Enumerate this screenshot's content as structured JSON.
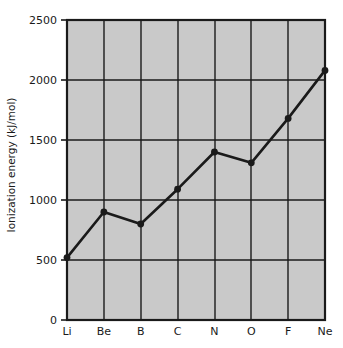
{
  "chart_data": {
    "type": "line",
    "title": "",
    "xlabel": "",
    "ylabel": "Ionization energy (kJ/mol)",
    "categories": [
      "Li",
      "Be",
      "B",
      "C",
      "N",
      "O",
      "F",
      "Ne"
    ],
    "values": [
      520,
      900,
      800,
      1090,
      1400,
      1310,
      1680,
      2080
    ],
    "series": [
      {
        "name": "Ionization energy",
        "values": [
          520,
          900,
          800,
          1090,
          1400,
          1310,
          1680,
          2080
        ]
      }
    ],
    "ylim": [
      0,
      2500
    ],
    "y_ticks": [
      0,
      500,
      1000,
      1500,
      2000,
      2500
    ],
    "y_tick_labels": [
      "0",
      "500",
      "1000",
      "1500",
      "2000",
      "2500"
    ],
    "x_tick_labels": [
      "Li",
      "Be",
      "B",
      "C",
      "N",
      "O",
      "F",
      "Ne"
    ],
    "grid": true,
    "legend": "none",
    "marker": "filled-circle",
    "colors": {
      "plot_background": "#c9c9c9",
      "line": "#1a1a1a",
      "marker": "#1a1a1a",
      "grid": "#1a1a1a",
      "axis": "#1a1a1a",
      "page_background": "#ffffff",
      "text": "#1a1a1a"
    }
  }
}
